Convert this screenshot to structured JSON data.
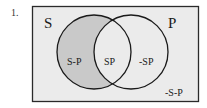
{
  "problem": {
    "number_label": "1."
  },
  "diagram": {
    "type": "venn",
    "universe_fill": "#ebebeb",
    "shaded_fill": "#c9c9c9",
    "stroke_color": "#1a1a1a",
    "sets": [
      {
        "name": "S",
        "label": "S"
      },
      {
        "name": "P",
        "label": "P"
      }
    ],
    "regions": {
      "s_only": {
        "label": "S-P",
        "shaded": true
      },
      "intersection": {
        "label": "SP",
        "shaded": false
      },
      "p_only": {
        "label": "-SP",
        "shaded": false
      },
      "outside": {
        "label": "-S-P",
        "shaded": false
      }
    }
  }
}
